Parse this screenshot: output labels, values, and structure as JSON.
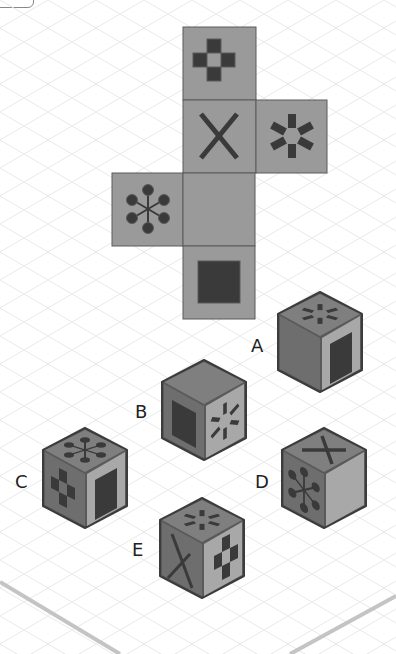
{
  "puzzle": {
    "net": {
      "faces": [
        {
          "id": "top",
          "symbol": "cross-checker",
          "x": 183,
          "y": 27
        },
        {
          "id": "front",
          "symbol": "x-mark",
          "x": 183,
          "y": 100
        },
        {
          "id": "right",
          "symbol": "asterisk-burst",
          "x": 256,
          "y": 100
        },
        {
          "id": "left",
          "symbol": "dot-snowflake",
          "x": 112,
          "y": 173
        },
        {
          "id": "bottom-blank",
          "symbol": "blank",
          "x": 183,
          "y": 173
        },
        {
          "id": "back",
          "symbol": "black-square",
          "x": 183,
          "y": 246
        }
      ],
      "face_size": 72
    },
    "options": [
      {
        "label": "A",
        "top": "asterisk-burst",
        "left": "blank",
        "right": "black-square"
      },
      {
        "label": "B",
        "top": "blank",
        "left": "black-square",
        "right": "asterisk-burst"
      },
      {
        "label": "C",
        "top": "dot-snowflake",
        "left": "cross-checker",
        "right": "black-square"
      },
      {
        "label": "D",
        "top": "x-mark",
        "left": "dot-snowflake",
        "right": "blank"
      },
      {
        "label": "E",
        "top": "asterisk-burst",
        "left": "x-mark",
        "right": "cross-checker"
      }
    ]
  },
  "labels": {
    "a": "A",
    "b": "B",
    "c": "C",
    "d": "D",
    "e": "E"
  },
  "colors": {
    "face": "#9a9a9a",
    "symbol": "#3a3a3a",
    "outline": "#5a5a5a",
    "cube_top": "#7f7f7f",
    "cube_left": "#6e6e6e",
    "cube_right": "#a8a8a8",
    "grid": "#e6e6e6",
    "platform_edge": "#bdbdbd"
  }
}
